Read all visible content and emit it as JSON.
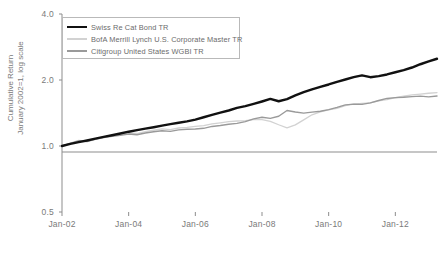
{
  "chart_data": {
    "type": "line",
    "title": "",
    "xlabel": "",
    "ylabel": "Cumulative Return",
    "ylabel_line2": "January 2002=1, log scale",
    "yscale": "log",
    "ylim": [
      0.5,
      4.0
    ],
    "ytick_labels": [
      "4.0",
      "2.0",
      "1.0",
      "0.5"
    ],
    "ytick_values": [
      4.0,
      2.0,
      1.0,
      0.5
    ],
    "xtick_labels": [
      "Jan-02",
      "Jan-04",
      "Jan-06",
      "Jan-08",
      "Jan-10",
      "Jan-12"
    ],
    "xlim": [
      "Jan-02",
      "Jan-13"
    ],
    "grid": false,
    "legend_position": "top-left",
    "x": [
      "2002.00",
      "2002.25",
      "2002.50",
      "2002.75",
      "2003.00",
      "2003.25",
      "2003.50",
      "2003.75",
      "2004.00",
      "2004.25",
      "2004.50",
      "2004.75",
      "2005.00",
      "2005.25",
      "2005.50",
      "2005.75",
      "2006.00",
      "2006.25",
      "2006.50",
      "2006.75",
      "2007.00",
      "2007.25",
      "2007.50",
      "2007.75",
      "2008.00",
      "2008.25",
      "2008.50",
      "2008.75",
      "2009.00",
      "2009.25",
      "2009.50",
      "2009.75",
      "2010.00",
      "2010.25",
      "2010.50",
      "2010.75",
      "2011.00",
      "2011.25",
      "2011.50",
      "2011.75",
      "2012.00",
      "2012.25",
      "2012.50",
      "2012.75",
      "2013.00",
      "2013.25"
    ],
    "series": [
      {
        "name": "Swiss Re Cat Bond TR",
        "color": "#111111",
        "width": 2.4,
        "values": [
          1.0,
          1.022,
          1.042,
          1.06,
          1.08,
          1.1,
          1.12,
          1.14,
          1.162,
          1.182,
          1.2,
          1.218,
          1.238,
          1.258,
          1.276,
          1.296,
          1.32,
          1.352,
          1.386,
          1.42,
          1.452,
          1.492,
          1.52,
          1.556,
          1.596,
          1.64,
          1.6,
          1.636,
          1.7,
          1.76,
          1.812,
          1.86,
          1.908,
          1.962,
          2.01,
          2.062,
          2.1,
          2.06,
          2.082,
          2.12,
          2.17,
          2.22,
          2.28,
          2.36,
          2.43,
          2.5
        ]
      },
      {
        "name": "BofA Merrill Lynch U.S. Corporate Master TR",
        "color": "#d2d2d2",
        "width": 1.3,
        "values": [
          1.0,
          1.03,
          1.06,
          1.052,
          1.076,
          1.1,
          1.118,
          1.13,
          1.148,
          1.14,
          1.162,
          1.18,
          1.196,
          1.188,
          1.208,
          1.216,
          1.228,
          1.238,
          1.262,
          1.276,
          1.292,
          1.3,
          1.306,
          1.318,
          1.318,
          1.296,
          1.25,
          1.21,
          1.248,
          1.316,
          1.388,
          1.43,
          1.462,
          1.486,
          1.528,
          1.552,
          1.566,
          1.574,
          1.606,
          1.628,
          1.66,
          1.686,
          1.712,
          1.726,
          1.74,
          1.752
        ]
      },
      {
        "name": "Citigroup United States WGBI TR",
        "color": "#9a9a9a",
        "width": 1.4,
        "values": [
          1.0,
          1.028,
          1.056,
          1.048,
          1.072,
          1.094,
          1.106,
          1.118,
          1.134,
          1.126,
          1.146,
          1.162,
          1.174,
          1.166,
          1.184,
          1.192,
          1.196,
          1.204,
          1.228,
          1.24,
          1.256,
          1.268,
          1.292,
          1.33,
          1.352,
          1.336,
          1.366,
          1.452,
          1.43,
          1.412,
          1.428,
          1.44,
          1.466,
          1.5,
          1.54,
          1.552,
          1.548,
          1.572,
          1.612,
          1.648,
          1.662,
          1.668,
          1.68,
          1.688,
          1.676,
          1.69
        ]
      }
    ]
  },
  "legend": {
    "items": [
      {
        "label": "Swiss Re Cat Bond TR"
      },
      {
        "label": "BofA Merrill Lynch U.S. Corporate Master TR"
      },
      {
        "label": "Citigroup United States WGBI TR"
      }
    ]
  },
  "axes": {
    "y_title_line1": "Cumulative Return",
    "y_title_line2": "January 2002=1, log scale"
  }
}
